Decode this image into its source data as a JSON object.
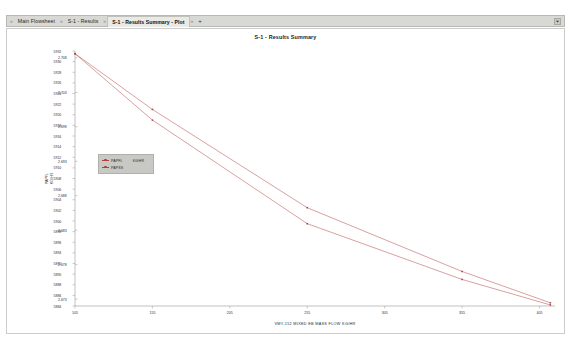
{
  "window": {
    "tab_bar": {
      "tabs": [
        {
          "label": "Main Flowsheet",
          "active": false
        },
        {
          "label": "S-1 - Results",
          "active": false
        },
        {
          "label": "S-1 - Results Summary - Plot",
          "active": true
        }
      ],
      "separator": "»",
      "add_tab_label": "+",
      "overflow_icon": "chevron-down-icon"
    }
  },
  "chart_data": {
    "type": "line",
    "title": "S-1 - Results Summary",
    "xlabel": "VMY-152   MIXED   EB MASS FLOW   KG/HR",
    "ylabel_left": "PAPFL",
    "ylabel_right": "KG/HR",
    "background": "#ffffff",
    "grid": false,
    "legend_position": "inside-left",
    "legend_units": "KG/HR",
    "axis_color": "#999999",
    "series_color": "#b04040",
    "x": {
      "ticks": [
        105,
        155,
        205,
        255,
        305,
        355,
        405
      ],
      "min": 105,
      "max": 415
    },
    "y_left": {
      "label": "PAPFL",
      "ticks": [
        5932,
        5930,
        5928,
        5926,
        5924,
        5922,
        5920,
        5918,
        5916,
        5914,
        5912,
        5910,
        5908,
        5906,
        5904,
        5902,
        5900,
        5898,
        5896,
        5894,
        5892,
        5890,
        5888,
        5886,
        5884
      ],
      "min": 5884,
      "max": 5932
    },
    "y_right": {
      "label": "KG/HR",
      "ticks": [
        2.708,
        2.703,
        2.698,
        2.693,
        2.688,
        2.683,
        2.678,
        2.673
      ],
      "min": 2.672,
      "max": 2.709
    },
    "series": [
      {
        "name": "PAPFL",
        "color": "#b04040",
        "points": [
          [
            105,
            5931.5
          ],
          [
            155,
            5921.0
          ],
          [
            255,
            5902.5
          ],
          [
            355,
            5890.5
          ],
          [
            412,
            5884.6
          ]
        ]
      },
      {
        "name": "PAPSS",
        "color": "#b04040",
        "points": [
          [
            105,
            5931.5
          ],
          [
            155,
            5919.0
          ],
          [
            255,
            5899.5
          ],
          [
            355,
            5889.0
          ],
          [
            412,
            5884.2
          ]
        ]
      }
    ]
  }
}
